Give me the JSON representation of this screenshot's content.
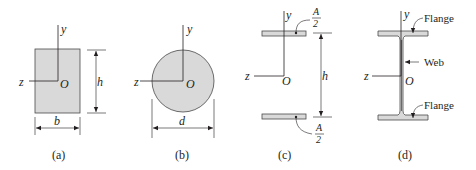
{
  "figure": {
    "colors": {
      "fill": "#d9d9d9",
      "stroke": "#4a4a4a",
      "text": "#231f20",
      "background": "#ffffff"
    },
    "panels": [
      {
        "id": "a",
        "caption": "(a)",
        "shape": "rectangle",
        "axes": {
          "y": "y",
          "z": "z",
          "origin": "O"
        },
        "dimensions": {
          "width": "b",
          "height": "h"
        }
      },
      {
        "id": "b",
        "caption": "(b)",
        "shape": "circle",
        "axes": {
          "y": "y",
          "z": "z",
          "origin": "O"
        },
        "dimensions": {
          "diameter": "d"
        }
      },
      {
        "id": "c",
        "caption": "(c)",
        "shape": "two thin flanges",
        "axes": {
          "y": "y",
          "z": "z",
          "origin": "O"
        },
        "dimensions": {
          "height": "h"
        },
        "area_labels": {
          "top": {
            "num": "A",
            "den": "2"
          },
          "bottom": {
            "num": "A",
            "den": "2"
          }
        }
      },
      {
        "id": "d",
        "caption": "(d)",
        "shape": "wide-flange I-beam",
        "axes": {
          "y": "y",
          "z": "z",
          "origin": "O"
        },
        "callouts": {
          "top_flange": "Flange",
          "web": "Web",
          "bottom_flange": "Flange"
        }
      }
    ]
  }
}
